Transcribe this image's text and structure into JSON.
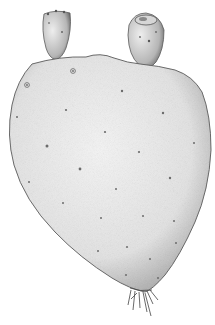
{
  "illustration": {
    "subject": "Prickly pear cactus pad with two fruits",
    "style": "stippled botanical engraving",
    "colors": {
      "background": "#ffffff",
      "pad_fill": "#ececec",
      "pad_shade": "#bdbdbd",
      "outline": "#5a5a5a",
      "areole": "#6b6b6b"
    },
    "elements": [
      {
        "name": "left-fruit",
        "kind": "fruit"
      },
      {
        "name": "right-fruit",
        "kind": "fruit"
      },
      {
        "name": "cactus-pad",
        "kind": "cladode"
      },
      {
        "name": "root-base",
        "kind": "roots"
      }
    ]
  }
}
